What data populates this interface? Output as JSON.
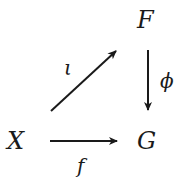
{
  "diagram": {
    "type": "commutative-diagram",
    "nodes": {
      "F": "F",
      "X": "X",
      "G": "G"
    },
    "arrows": [
      {
        "from": "X",
        "to": "F",
        "label": "ι"
      },
      {
        "from": "F",
        "to": "G",
        "label": "ϕ"
      },
      {
        "from": "X",
        "to": "G",
        "label": "f"
      }
    ],
    "labels": {
      "iota": "ι",
      "phi": "ϕ",
      "f": "f"
    },
    "colors": {
      "ink": "#1a1a1a",
      "background": "#ffffff"
    }
  }
}
